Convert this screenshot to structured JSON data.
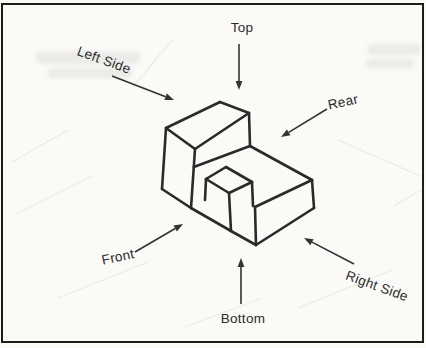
{
  "drawing": {
    "ink_color": "#2a2a2a",
    "arrow_color": "#333333",
    "paper_color": "#fafaf7",
    "border_color": "#1c1c1c",
    "labels": {
      "top": "Top",
      "left_side": "Left Side",
      "rear": "Rear",
      "front": "Front",
      "bottom": "Bottom",
      "right_side": "Right Side"
    },
    "arrows": [
      {
        "id": "top-arrow",
        "x1": 239,
        "y1": 44,
        "x2": 239,
        "y2": 90
      },
      {
        "id": "left-side-arrow",
        "x1": 112,
        "y1": 76,
        "x2": 174,
        "y2": 100
      },
      {
        "id": "rear-arrow",
        "x1": 327,
        "y1": 109,
        "x2": 281,
        "y2": 137
      },
      {
        "id": "front-arrow",
        "x1": 135,
        "y1": 252,
        "x2": 183,
        "y2": 224
      },
      {
        "id": "bottom-arrow",
        "x1": 241,
        "y1": 304,
        "x2": 241,
        "y2": 258
      },
      {
        "id": "right-side-arrow",
        "x1": 354,
        "y1": 264,
        "x2": 304,
        "y2": 238
      }
    ],
    "object_segments": [
      [
        220,
        102,
        166,
        128
      ],
      [
        220,
        102,
        249,
        113
      ],
      [
        166,
        128,
        195,
        149
      ],
      [
        195,
        149,
        249,
        113
      ],
      [
        166,
        128,
        162,
        189
      ],
      [
        162,
        189,
        191,
        208
      ],
      [
        195,
        149,
        191,
        208
      ],
      [
        249,
        113,
        250,
        146
      ],
      [
        250,
        146,
        193.8,
        167
      ],
      [
        250,
        146,
        312,
        180
      ],
      [
        312,
        180,
        314,
        208
      ],
      [
        314,
        208,
        256,
        245
      ],
      [
        312,
        180,
        255,
        207
      ],
      [
        255,
        207,
        256,
        245
      ],
      [
        191,
        208,
        231,
        231
      ],
      [
        231,
        231,
        256,
        245
      ],
      [
        231,
        231,
        229,
        193
      ],
      [
        229,
        193,
        206,
        179
      ],
      [
        206,
        179,
        226,
        167
      ],
      [
        226,
        167,
        252,
        182
      ],
      [
        252,
        182,
        229,
        193
      ],
      [
        206,
        179,
        205,
        200
      ],
      [
        252,
        182,
        253,
        206
      ]
    ],
    "ghost_segments": [
      [
        12,
        162,
        68,
        130
      ],
      [
        16,
        214,
        92,
        176
      ],
      [
        58,
        298,
        148,
        262
      ],
      [
        182,
        328,
        262,
        298
      ],
      [
        298,
        308,
        392,
        270
      ],
      [
        394,
        206,
        424,
        188
      ],
      [
        338,
        140,
        420,
        176
      ],
      [
        132,
        88,
        172,
        40
      ]
    ]
  }
}
